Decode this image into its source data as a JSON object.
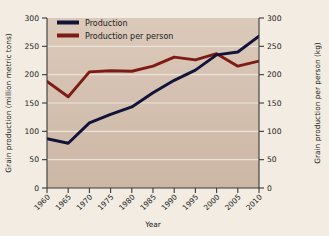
{
  "chart_data": {
    "type": "line",
    "title": "",
    "xlabel": "Year",
    "ylabel": "Grain production (million metric tons)",
    "y2label": "Grain production per person (kg)",
    "x": [
      1960,
      1965,
      1970,
      1975,
      1980,
      1985,
      1990,
      1995,
      2000,
      2005,
      2010
    ],
    "categories": [
      "1960",
      "1965",
      "1970",
      "1975",
      "1980",
      "1985",
      "1990",
      "1995",
      "2000",
      "2005",
      "2010"
    ],
    "xlim": [
      1960,
      2010
    ],
    "ylim": [
      0,
      300
    ],
    "y2lim": [
      0,
      300
    ],
    "yticks": [
      0,
      50,
      100,
      150,
      200,
      250,
      300
    ],
    "ytick_labels": [
      "0",
      "50",
      "100",
      "150",
      "200",
      "250",
      "300"
    ],
    "y2ticks": [
      0,
      50,
      100,
      150,
      200,
      250,
      300
    ],
    "y2tick_labels": [
      "0",
      "50",
      "100",
      "150",
      "200",
      "250",
      "300"
    ],
    "grid": "horizontal",
    "legend_position": "top-left",
    "series": [
      {
        "name": "Production",
        "axis": "left",
        "color": "#12133a",
        "units": "million metric tons",
        "values": [
          87,
          79,
          115,
          130,
          143,
          168,
          190,
          208,
          235,
          240,
          268
        ]
      },
      {
        "name": "Production per person",
        "axis": "right",
        "color": "#7d1c14",
        "units": "kg",
        "values": [
          188,
          161,
          205,
          207,
          206,
          215,
          231,
          226,
          237,
          215,
          224
        ]
      }
    ]
  },
  "legend": {
    "items": [
      {
        "label": "Production",
        "color": "#12133a"
      },
      {
        "label": "Production per person",
        "color": "#7d1c14"
      }
    ]
  },
  "colors": {
    "page_background": "#f2ece2",
    "plot_background_top": "#d9c6b6",
    "plot_background_bottom": "#cdb9a8",
    "gridline": "#efe7dd",
    "axis": "#3a3a3a",
    "text": "#1c1c1c",
    "series_production": "#12133a",
    "series_per_person": "#7d1c14"
  }
}
